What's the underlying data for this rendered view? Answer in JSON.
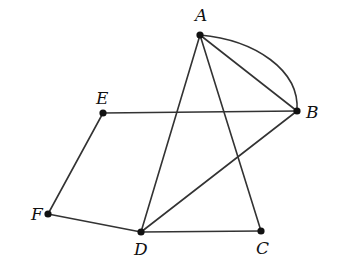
{
  "diagram": {
    "type": "geometry-figure",
    "points": [
      {
        "name": "A",
        "x": 200,
        "y": 35,
        "label_x": 195,
        "label_y": 21
      },
      {
        "name": "B",
        "x": 297,
        "y": 111,
        "label_x": 306,
        "label_y": 118
      },
      {
        "name": "C",
        "x": 261,
        "y": 231,
        "label_x": 256,
        "label_y": 254
      },
      {
        "name": "D",
        "x": 141,
        "y": 232,
        "label_x": 134,
        "label_y": 255
      },
      {
        "name": "E",
        "x": 103,
        "y": 113,
        "label_x": 96,
        "label_y": 104
      },
      {
        "name": "F",
        "x": 48,
        "y": 214,
        "label_x": 31,
        "label_y": 220
      }
    ],
    "segments": [
      {
        "from": "A",
        "to": "B"
      },
      {
        "from": "A",
        "to": "D"
      },
      {
        "from": "A",
        "to": "C"
      },
      {
        "from": "E",
        "to": "B"
      },
      {
        "from": "D",
        "to": "B"
      },
      {
        "from": "D",
        "to": "C"
      },
      {
        "from": "E",
        "to": "F"
      },
      {
        "from": "F",
        "to": "D"
      }
    ],
    "arcs": [
      {
        "from": "A",
        "to": "B",
        "description": "curved arc bulging outward to the upper-right between A and B"
      }
    ],
    "stroke_color": "#333333",
    "point_color": "#111111"
  }
}
